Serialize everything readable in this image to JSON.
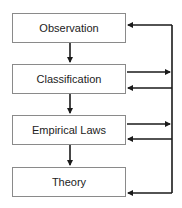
{
  "diagram": {
    "type": "flowchart",
    "nodes": [
      {
        "id": "observation",
        "label": "Observation"
      },
      {
        "id": "classification",
        "label": "Classification"
      },
      {
        "id": "empirical_laws",
        "label": "Empirical Laws"
      },
      {
        "id": "theory",
        "label": "Theory"
      }
    ],
    "edges": [
      {
        "from": "observation",
        "to": "classification"
      },
      {
        "from": "classification",
        "to": "empirical_laws"
      },
      {
        "from": "empirical_laws",
        "to": "theory"
      },
      {
        "from": "classification",
        "to": "feedback_line"
      },
      {
        "from": "empirical_laws",
        "to": "feedback_line"
      },
      {
        "from": "feedback_line",
        "to": "observation"
      },
      {
        "from": "feedback_line",
        "to": "classification"
      },
      {
        "from": "feedback_line",
        "to": "empirical_laws"
      },
      {
        "from": "feedback_line",
        "to": "theory"
      }
    ],
    "colors": {
      "box_border": "#8a8a8a",
      "arrow": "#1a1a1a",
      "text": "#222222"
    }
  }
}
